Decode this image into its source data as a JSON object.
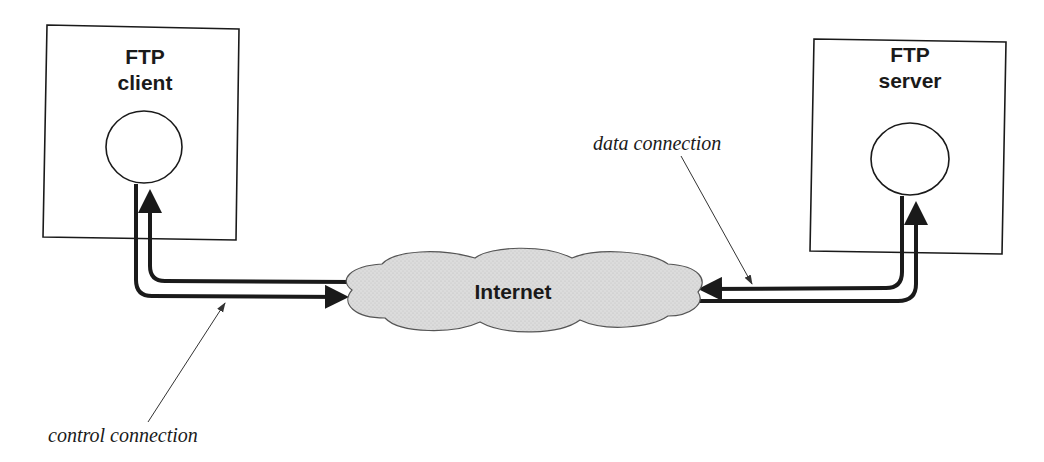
{
  "diagram": {
    "client": {
      "line1": "FTP",
      "line2": "client"
    },
    "server": {
      "line1": "FTP",
      "line2": "server"
    },
    "network": {
      "label": "Internet"
    },
    "annotations": {
      "control": "control connection",
      "data": "data connection"
    },
    "colors": {
      "stroke": "#1a1a1a",
      "cloud_fill": "#d9d9d9",
      "background": "#ffffff"
    }
  }
}
